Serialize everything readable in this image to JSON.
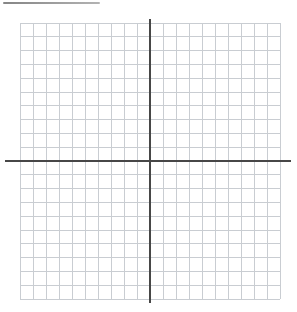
{
  "page": {
    "background": "#ffffff"
  },
  "decorations": {
    "top_partial_rule": {
      "color_start": "#858585",
      "color_end": "#b3b3b3"
    }
  },
  "chart_data": {
    "type": "scatter",
    "title": "",
    "xlabel": "",
    "ylabel": "",
    "series": [],
    "xlim": [
      -10,
      10
    ],
    "ylim": [
      -10,
      10
    ],
    "grid": true,
    "grid_step": 1,
    "legend": false,
    "tick_labels_visible": false,
    "axis_labels_visible": false,
    "colors": {
      "grid": "#c9cdd2",
      "axis": "#474747",
      "background": "#ffffff"
    }
  }
}
